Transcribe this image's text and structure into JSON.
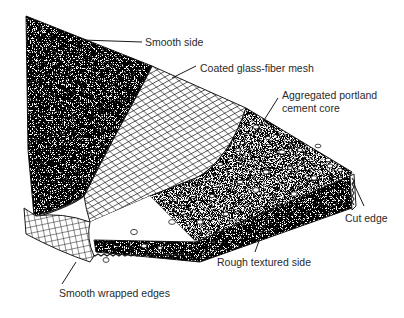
{
  "diagram": {
    "labels": {
      "smooth_side": "Smooth side",
      "mesh": "Coated glass-fiber mesh",
      "core_line1": "Aggregated portland",
      "core_line2": "cement core",
      "cut_edge": "Cut edge",
      "rough_side": "Rough textured side",
      "wrapped_edges": "Smooth wrapped edges"
    },
    "colors": {
      "ink": "#1a1a1a",
      "label": "#2a2a2a",
      "paper": "#ffffff"
    }
  }
}
